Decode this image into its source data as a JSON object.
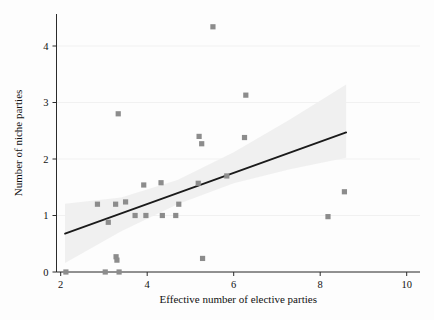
{
  "chart_data": {
    "type": "scatter",
    "title": "",
    "xlabel": "Effective number of elective parties",
    "ylabel": "Number of niche parties",
    "xlim": [
      2,
      10
    ],
    "ylim": [
      0,
      4.6
    ],
    "xticks": [
      2,
      4,
      6,
      8,
      10
    ],
    "yticks": [
      0,
      1,
      2,
      3,
      4
    ],
    "xticklabels": [
      "2",
      "4",
      "6",
      "8",
      "10"
    ],
    "yticklabels": [
      "0",
      "1",
      "2",
      "3",
      "4"
    ],
    "grid": "horizontal-faint",
    "legend": "none",
    "marker": "square",
    "marker_color": "#8c8c8c",
    "line_color": "#1a1a1a",
    "band_color": "#efefef",
    "points": [
      {
        "x": 2.12,
        "y": 0.0
      },
      {
        "x": 2.85,
        "y": 1.2
      },
      {
        "x": 3.03,
        "y": 0.0
      },
      {
        "x": 3.1,
        "y": 0.88
      },
      {
        "x": 3.27,
        "y": 1.2
      },
      {
        "x": 3.28,
        "y": 0.27
      },
      {
        "x": 3.3,
        "y": 0.21
      },
      {
        "x": 3.33,
        "y": 2.8
      },
      {
        "x": 3.35,
        "y": 0.0
      },
      {
        "x": 3.5,
        "y": 1.24
      },
      {
        "x": 3.72,
        "y": 1.0
      },
      {
        "x": 3.92,
        "y": 1.54
      },
      {
        "x": 3.97,
        "y": 1.0
      },
      {
        "x": 4.32,
        "y": 1.58
      },
      {
        "x": 4.35,
        "y": 1.0
      },
      {
        "x": 4.66,
        "y": 1.0
      },
      {
        "x": 4.73,
        "y": 1.2
      },
      {
        "x": 5.18,
        "y": 1.57
      },
      {
        "x": 5.2,
        "y": 2.4
      },
      {
        "x": 5.26,
        "y": 2.27
      },
      {
        "x": 5.28,
        "y": 0.24
      },
      {
        "x": 5.52,
        "y": 4.34
      },
      {
        "x": 5.84,
        "y": 1.7
      },
      {
        "x": 6.25,
        "y": 2.38
      },
      {
        "x": 6.28,
        "y": 3.13
      },
      {
        "x": 8.18,
        "y": 0.98
      },
      {
        "x": 8.56,
        "y": 1.42
      }
    ],
    "fit_line": {
      "x_start": 2.1,
      "y_start": 0.68,
      "x_end": 8.6,
      "y_end": 2.47
    },
    "confidence_band": {
      "x_start": 2.1,
      "x_end": 8.6,
      "upper": [
        {
          "x": 2.1,
          "y": 1.21
        },
        {
          "x": 3.4,
          "y": 1.32
        },
        {
          "x": 4.7,
          "y": 1.63
        },
        {
          "x": 6.0,
          "y": 2.12
        },
        {
          "x": 7.3,
          "y": 2.7
        },
        {
          "x": 8.6,
          "y": 3.32
        }
      ],
      "lower": [
        {
          "x": 2.1,
          "y": 0.16
        },
        {
          "x": 3.4,
          "y": 0.72
        },
        {
          "x": 4.7,
          "y": 1.2
        },
        {
          "x": 6.0,
          "y": 1.57
        },
        {
          "x": 7.3,
          "y": 1.82
        },
        {
          "x": 8.6,
          "y": 2.02
        }
      ]
    }
  }
}
